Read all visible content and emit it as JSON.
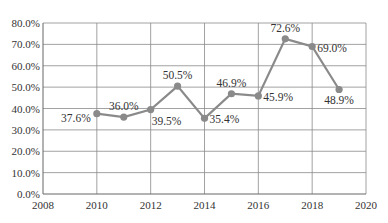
{
  "chart_data": {
    "type": "line",
    "title": "",
    "xlabel": "",
    "ylabel": "",
    "xlim": [
      2008,
      2020
    ],
    "ylim": [
      0,
      80
    ],
    "x_ticks": [
      2008,
      2010,
      2012,
      2014,
      2016,
      2018,
      2020
    ],
    "x_tick_labels": [
      "2008",
      "2010",
      "2012",
      "2014",
      "2016",
      "2018",
      "2020"
    ],
    "y_ticks": [
      0,
      10,
      20,
      30,
      40,
      50,
      60,
      70,
      80
    ],
    "y_tick_labels": [
      "0.0%",
      "10.0%",
      "20.0%",
      "30.0%",
      "40.0%",
      "50.0%",
      "60.0%",
      "70.0%",
      "80.0%"
    ],
    "grid": true,
    "legend": null,
    "series": [
      {
        "name": "",
        "color": "#8a8a8a",
        "x": [
          2010,
          2011,
          2012,
          2013,
          2014,
          2015,
          2016,
          2017,
          2018,
          2019
        ],
        "values": [
          37.6,
          36.0,
          39.5,
          50.5,
          35.4,
          46.9,
          45.9,
          72.6,
          69.0,
          48.9
        ],
        "labels": [
          "37.6%",
          "36.0%",
          "39.5%",
          "50.5%",
          "35.4%",
          "46.9%",
          "45.9%",
          "72.6%",
          "69.0%",
          "48.9%"
        ],
        "label_positions": [
          "left",
          "above",
          "below-right",
          "above",
          "right",
          "above",
          "right",
          "above",
          "right",
          "below"
        ]
      }
    ]
  }
}
